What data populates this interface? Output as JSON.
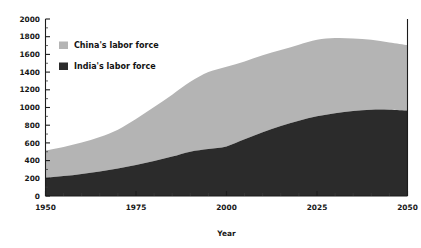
{
  "chart_data": {
    "type": "area",
    "title": "",
    "subtitle": "",
    "xlabel": "Year",
    "ylabel": "",
    "stacked": true,
    "grid": false,
    "legend_position": "upper-left-inside",
    "xlim": [
      1950,
      2050
    ],
    "ylim": [
      0,
      2000
    ],
    "x_ticks": [
      1950,
      1975,
      2000,
      2025,
      2050
    ],
    "x_tick_labels": [
      "1950",
      "1975",
      "2000",
      "2025",
      "2050"
    ],
    "x_minor_step": 5,
    "y_ticks": [
      0,
      200,
      400,
      600,
      800,
      1000,
      1200,
      1400,
      1600,
      1800,
      2000
    ],
    "y_tick_labels": [
      "0",
      "200",
      "400",
      "600",
      "800",
      "1000",
      "1200",
      "1400",
      "1600",
      "1800",
      "2000"
    ],
    "y_minor_step": 100,
    "x": [
      1950,
      1955,
      1960,
      1965,
      1970,
      1975,
      1980,
      1985,
      1990,
      1995,
      2000,
      2005,
      2010,
      2015,
      2020,
      2025,
      2030,
      2035,
      2040,
      2045,
      2050
    ],
    "series": [
      {
        "name": "India's labor force",
        "color": "#2b2b2b",
        "values": [
          205,
          225,
          250,
          278,
          310,
          350,
          395,
          445,
          500,
          530,
          560,
          640,
          720,
          790,
          850,
          900,
          935,
          960,
          975,
          975,
          965
        ]
      },
      {
        "name": "China's labor force",
        "color": "#b4b4b4",
        "values": [
          310,
          330,
          355,
          390,
          440,
          520,
          610,
          700,
          790,
          870,
          900,
          880,
          870,
          860,
          860,
          865,
          850,
          820,
          790,
          760,
          740
        ]
      }
    ],
    "cumulative_top": [
      515,
      555,
      605,
      668,
      750,
      870,
      1005,
      1145,
      1290,
      1400,
      1460,
      1520,
      1590,
      1650,
      1710,
      1765,
      1785,
      1780,
      1765,
      1735,
      1705
    ],
    "legend": [
      {
        "label": "China's labor force",
        "color": "#b4b4b4"
      },
      {
        "label": "India's labor force",
        "color": "#2b2b2b"
      }
    ]
  },
  "figure": {
    "background": "#ffffff",
    "axis_color": "#1c1c1c"
  }
}
